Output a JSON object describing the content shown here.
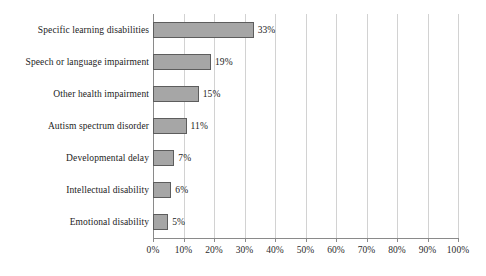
{
  "chart_data": {
    "type": "bar",
    "orientation": "horizontal",
    "title": "",
    "subtitle": "",
    "xlabel": "",
    "ylabel": "",
    "xlim": [
      0,
      100
    ],
    "xtick_step": 10,
    "grid": true,
    "legend": "none",
    "value_suffix": "%",
    "categories": [
      "Specific learning disabilities",
      "Speech or language impairment",
      "Other health impairment",
      "Autism spectrum disorder",
      "Developmental delay",
      "Intellectual disability",
      "Emotional disability"
    ],
    "values": [
      33,
      19,
      15,
      11,
      7,
      6,
      5
    ],
    "data_labels": [
      "33%",
      "19%",
      "15%",
      "11%",
      "7%",
      "6%",
      "5%"
    ],
    "xtick_labels": [
      "0%",
      "10%",
      "20%",
      "30%",
      "40%",
      "50%",
      "60%",
      "70%",
      "80%",
      "90%",
      "100%"
    ],
    "xtick_values": [
      0,
      10,
      20,
      30,
      40,
      50,
      60,
      70,
      80,
      90,
      100
    ],
    "colors": {
      "bar_fill": "#a6a6a6",
      "bar_border": "#5d5d5d",
      "gridline": "#d2d2d2",
      "axis": "#8a8a8a",
      "text": "#1c1c1c",
      "background": "#ffffff"
    }
  }
}
